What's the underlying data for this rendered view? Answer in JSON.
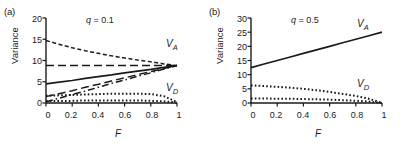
{
  "figure": {
    "width": 409,
    "height": 148,
    "background": "#ffffff",
    "ink_color": "#1a1a1a"
  },
  "panels": [
    {
      "key": "a",
      "label": "(a)",
      "annotation_q": "q = 0.1",
      "q_symbol": "q",
      "q_value": "= 0.1",
      "xlabel": "F",
      "ylabel": "Variance",
      "xticks": [
        "0",
        "0.2",
        "0.4",
        "0.6",
        "0.8",
        "1"
      ],
      "yticks": [
        "0",
        "5",
        "10",
        "15",
        "20"
      ],
      "curve_label_a": "V",
      "curve_label_a_sub": "A",
      "curve_label_d": "V",
      "curve_label_d_sub": "D"
    },
    {
      "key": "b",
      "label": "(b)",
      "annotation_q": "q = 0.5",
      "q_symbol": "q",
      "q_value": "= 0.5",
      "xlabel": "F",
      "ylabel": "Variance",
      "xticks": [
        "0",
        "0.2",
        "0.4",
        "0.6",
        "0.8",
        "1"
      ],
      "yticks": [
        "0",
        "5",
        "10",
        "15",
        "20",
        "25",
        "30"
      ],
      "curve_label_a": "V",
      "curve_label_a_sub": "A",
      "curve_label_d": "V",
      "curve_label_d_sub": "D"
    }
  ],
  "chart_data": [
    {
      "type": "line",
      "panel": "a",
      "title": "(a)",
      "annotation": "q = 0.1",
      "xlabel": "F",
      "ylabel": "Variance",
      "xlim": [
        0,
        1
      ],
      "ylim": [
        0,
        20
      ],
      "xticks": [
        0,
        0.2,
        0.4,
        0.6,
        0.8,
        1
      ],
      "yticks": [
        0,
        5,
        10,
        15,
        20
      ],
      "grid": false,
      "legend": "none",
      "annotations": [
        {
          "text": "V_A",
          "x": 0.88,
          "y": 11.5
        },
        {
          "text": "V_D",
          "x": 0.88,
          "y": 3.0
        }
      ],
      "x": [
        0,
        0.1,
        0.2,
        0.3,
        0.4,
        0.5,
        0.6,
        0.7,
        0.8,
        0.9,
        1.0
      ],
      "series": [
        {
          "name": "VA-short-dashed",
          "style": "short-dashed",
          "group": "VA",
          "values": [
            14.7,
            13.8,
            13.0,
            12.3,
            11.7,
            11.1,
            10.6,
            10.1,
            9.7,
            9.2,
            8.8
          ]
        },
        {
          "name": "VA-long-dashed-flat",
          "style": "long-dashed",
          "group": "VA",
          "values": [
            8.8,
            8.8,
            8.8,
            8.8,
            8.8,
            8.8,
            8.8,
            8.8,
            8.8,
            8.8,
            8.8
          ]
        },
        {
          "name": "VA-solid",
          "style": "solid",
          "group": "VA",
          "values": [
            4.5,
            4.9,
            5.3,
            5.8,
            6.2,
            6.6,
            7.1,
            7.5,
            7.9,
            8.4,
            8.8
          ]
        },
        {
          "name": "VA-long-dashed-rising",
          "style": "long-dashed",
          "group": "VA",
          "values": [
            1.5,
            2.2,
            2.9,
            3.7,
            4.4,
            5.2,
            5.9,
            6.7,
            7.4,
            8.1,
            8.8
          ]
        },
        {
          "name": "VA-dash-dot",
          "style": "dash-dot",
          "group": "VA",
          "values": [
            0.3,
            1.1,
            2.0,
            2.8,
            3.7,
            4.6,
            5.4,
            6.3,
            7.1,
            8.0,
            8.8
          ]
        },
        {
          "name": "VD-dotted-upper",
          "style": "dotted",
          "group": "VD",
          "values": [
            1.7,
            1.8,
            1.9,
            2.0,
            2.1,
            2.2,
            2.2,
            2.2,
            2.1,
            1.6,
            0.2
          ]
        },
        {
          "name": "VD-dotted-lower",
          "style": "dotted",
          "group": "VD",
          "values": [
            0.5,
            0.5,
            0.5,
            0.6,
            0.6,
            0.6,
            0.6,
            0.6,
            0.5,
            0.4,
            0.1
          ]
        }
      ]
    },
    {
      "type": "line",
      "panel": "b",
      "title": "(b)",
      "annotation": "q = 0.5",
      "xlabel": "F",
      "ylabel": "Variance",
      "xlim": [
        0,
        1
      ],
      "ylim": [
        0,
        30
      ],
      "xticks": [
        0,
        0.2,
        0.4,
        0.6,
        0.8,
        1
      ],
      "yticks": [
        0,
        5,
        10,
        15,
        20,
        25,
        30
      ],
      "grid": false,
      "legend": "none",
      "annotations": [
        {
          "text": "V_A",
          "x": 0.82,
          "y": 26.5
        },
        {
          "text": "V_D",
          "x": 0.82,
          "y": 6.0
        }
      ],
      "x": [
        0,
        0.1,
        0.2,
        0.3,
        0.4,
        0.5,
        0.6,
        0.7,
        0.8,
        0.9,
        1.0
      ],
      "series": [
        {
          "name": "VA-solid",
          "style": "solid",
          "group": "VA",
          "values": [
            12.5,
            13.75,
            15.0,
            16.25,
            17.5,
            18.75,
            20.0,
            21.25,
            22.5,
            23.75,
            25.0
          ]
        },
        {
          "name": "VD-dotted-upper",
          "style": "dotted",
          "group": "VD",
          "values": [
            6.2,
            6.0,
            5.7,
            5.4,
            5.0,
            4.5,
            3.9,
            3.2,
            2.5,
            1.5,
            0.0
          ]
        },
        {
          "name": "VD-dotted-lower",
          "style": "dotted",
          "group": "VD",
          "values": [
            1.6,
            1.6,
            1.5,
            1.5,
            1.4,
            1.3,
            1.2,
            1.0,
            0.8,
            0.5,
            0.0
          ]
        }
      ]
    }
  ]
}
